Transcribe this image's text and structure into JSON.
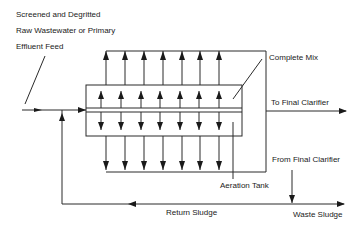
{
  "labels": {
    "feed_line1": "Screened and Degritted",
    "feed_line2": "Raw Wastewater or Primary",
    "feed_line3": "Effluent Feed",
    "complete_mix": "Complete Mix",
    "to_final_clarifier": "To Final Clarifier",
    "from_final_clarifier": "From Final Clarifier",
    "aeration_tank": "Aeration Tank",
    "return_sludge": "Return Sludge",
    "waste_sludge": "Waste Sludge"
  },
  "diagram": {
    "outer_mixing_zone": {
      "x1": 106,
      "y_top": 51,
      "x2": 266,
      "y_bottom": 172
    },
    "aeration_tank": {
      "x": 86,
      "y": 85,
      "width": 156,
      "height": 51,
      "divider_y1": 108,
      "divider_y2": 112
    },
    "outer_arrow_x": [
      106,
      125,
      144,
      163,
      182,
      200,
      219
    ],
    "inner_arrow_x": [
      101,
      121,
      141,
      160,
      180,
      199,
      219
    ],
    "colors": {
      "line": "#2a2a2a",
      "text": "#1a1a1a",
      "background": "#ffffff"
    }
  }
}
